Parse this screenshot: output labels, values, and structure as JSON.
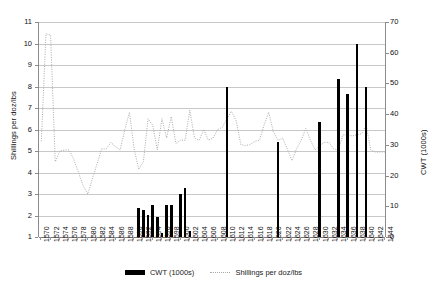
{
  "chart_data": {
    "type": "bar",
    "title": "",
    "subtitle": "",
    "xlabel": "",
    "ylabel": "Shillings per doz/lbs",
    "y2label": "CWT (1000s)",
    "ylim": [
      1,
      11
    ],
    "y2lim": [
      0,
      70
    ],
    "yticks": [
      1,
      2,
      3,
      4,
      5,
      6,
      7,
      8,
      9,
      10,
      11
    ],
    "y2ticks": [
      0,
      10,
      20,
      30,
      40,
      50,
      60,
      70
    ],
    "grid": true,
    "legend_position": "bottom",
    "x": [
      1570,
      1571,
      1572,
      1573,
      1574,
      1575,
      1576,
      1577,
      1578,
      1579,
      1580,
      1581,
      1582,
      1583,
      1584,
      1585,
      1586,
      1587,
      1588,
      1589,
      1590,
      1591,
      1592,
      1593,
      1594,
      1595,
      1596,
      1597,
      1598,
      1599,
      1600,
      1601,
      1602,
      1603,
      1604,
      1605,
      1606,
      1607,
      1608,
      1609,
      1610,
      1611,
      1612,
      1613,
      1614,
      1615,
      1616,
      1617,
      1618,
      1619,
      1620,
      1621,
      1622,
      1623,
      1624,
      1625,
      1626,
      1627,
      1628,
      1629,
      1630,
      1631,
      1632,
      1633,
      1634,
      1635,
      1636,
      1637,
      1638,
      1639,
      1640,
      1641,
      1642,
      1643,
      1644
    ],
    "xticks": [
      1570,
      1572,
      1574,
      1576,
      1578,
      1580,
      1582,
      1584,
      1586,
      1588,
      1590,
      1592,
      1594,
      1596,
      1598,
      1600,
      1602,
      1604,
      1606,
      1608,
      1610,
      1612,
      1614,
      1616,
      1618,
      1620,
      1622,
      1624,
      1626,
      1628,
      1630,
      1632,
      1634,
      1636,
      1638,
      1640,
      1642,
      1644
    ],
    "series": [
      {
        "name": "CWT (1000s)",
        "type": "bar",
        "axis": "right",
        "color": "#000000",
        "points": [
          {
            "x": 1591,
            "y": 9.6
          },
          {
            "x": 1592,
            "y": 8.9
          },
          {
            "x": 1593,
            "y": 7.2
          },
          {
            "x": 1594,
            "y": 10.3
          },
          {
            "x": 1595,
            "y": 6.4
          },
          {
            "x": 1596,
            "y": 1.2
          },
          {
            "x": 1597,
            "y": 10.4
          },
          {
            "x": 1598,
            "y": 10.4
          },
          {
            "x": 1600,
            "y": 14.1
          },
          {
            "x": 1601,
            "y": 16.0
          },
          {
            "x": 1602,
            "y": 2.0
          },
          {
            "x": 1610,
            "y": 49.0
          },
          {
            "x": 1621,
            "y": 31.0
          },
          {
            "x": 1630,
            "y": 37.3
          },
          {
            "x": 1634,
            "y": 51.3
          },
          {
            "x": 1636,
            "y": 46.5
          },
          {
            "x": 1638,
            "y": 62.8
          },
          {
            "x": 1640,
            "y": 49.0
          }
        ]
      },
      {
        "name": "Shillings per doz/lbs",
        "type": "line",
        "axis": "left",
        "color": "#aaaaaa",
        "style": "dotted",
        "points": [
          {
            "x": 1570,
            "y": 5.45
          },
          {
            "x": 1571,
            "y": 10.45
          },
          {
            "x": 1572,
            "y": 10.4
          },
          {
            "x": 1573,
            "y": 4.5
          },
          {
            "x": 1574,
            "y": 5.0
          },
          {
            "x": 1575,
            "y": 5.05
          },
          {
            "x": 1576,
            "y": 5.05
          },
          {
            "x": 1577,
            "y": 4.6
          },
          {
            "x": 1578,
            "y": 4.0
          },
          {
            "x": 1579,
            "y": 3.4
          },
          {
            "x": 1580,
            "y": 3.0
          },
          {
            "x": 1581,
            "y": 3.7
          },
          {
            "x": 1582,
            "y": 4.4
          },
          {
            "x": 1583,
            "y": 5.1
          },
          {
            "x": 1584,
            "y": 5.1
          },
          {
            "x": 1585,
            "y": 5.4
          },
          {
            "x": 1586,
            "y": 5.2
          },
          {
            "x": 1587,
            "y": 5.05
          },
          {
            "x": 1588,
            "y": 6.0
          },
          {
            "x": 1589,
            "y": 6.8
          },
          {
            "x": 1590,
            "y": 5.1
          },
          {
            "x": 1591,
            "y": 4.15
          },
          {
            "x": 1592,
            "y": 4.5
          },
          {
            "x": 1593,
            "y": 6.5
          },
          {
            "x": 1594,
            "y": 6.2
          },
          {
            "x": 1595,
            "y": 5.05
          },
          {
            "x": 1596,
            "y": 6.5
          },
          {
            "x": 1597,
            "y": 5.6
          },
          {
            "x": 1598,
            "y": 6.6
          },
          {
            "x": 1599,
            "y": 5.35
          },
          {
            "x": 1600,
            "y": 5.5
          },
          {
            "x": 1601,
            "y": 5.5
          },
          {
            "x": 1602,
            "y": 6.9
          },
          {
            "x": 1603,
            "y": 5.6
          },
          {
            "x": 1604,
            "y": 5.5
          },
          {
            "x": 1605,
            "y": 6.0
          },
          {
            "x": 1606,
            "y": 5.5
          },
          {
            "x": 1607,
            "y": 5.6
          },
          {
            "x": 1608,
            "y": 6.0
          },
          {
            "x": 1609,
            "y": 6.1
          },
          {
            "x": 1610,
            "y": 6.5
          },
          {
            "x": 1611,
            "y": 6.85
          },
          {
            "x": 1612,
            "y": 6.4
          },
          {
            "x": 1613,
            "y": 5.3
          },
          {
            "x": 1614,
            "y": 5.25
          },
          {
            "x": 1615,
            "y": 5.3
          },
          {
            "x": 1616,
            "y": 5.45
          },
          {
            "x": 1617,
            "y": 5.5
          },
          {
            "x": 1618,
            "y": 6.2
          },
          {
            "x": 1619,
            "y": 6.8
          },
          {
            "x": 1620,
            "y": 5.9
          },
          {
            "x": 1621,
            "y": 5.5
          },
          {
            "x": 1622,
            "y": 5.6
          },
          {
            "x": 1623,
            "y": 5.1
          },
          {
            "x": 1624,
            "y": 4.55
          },
          {
            "x": 1625,
            "y": 5.1
          },
          {
            "x": 1626,
            "y": 5.5
          },
          {
            "x": 1627,
            "y": 6.05
          },
          {
            "x": 1628,
            "y": 5.5
          },
          {
            "x": 1629,
            "y": 5.05
          },
          {
            "x": 1630,
            "y": 5.25
          },
          {
            "x": 1631,
            "y": 5.4
          },
          {
            "x": 1632,
            "y": 5.4
          },
          {
            "x": 1633,
            "y": 5.1
          },
          {
            "x": 1634,
            "y": 5.05
          },
          {
            "x": 1635,
            "y": 5.75
          },
          {
            "x": 1636,
            "y": 5.75
          },
          {
            "x": 1637,
            "y": 5.7
          },
          {
            "x": 1638,
            "y": 5.75
          },
          {
            "x": 1639,
            "y": 5.8
          },
          {
            "x": 1640,
            "y": 6.2
          },
          {
            "x": 1641,
            "y": 5.05
          },
          {
            "x": 1642,
            "y": 4.95
          },
          {
            "x": 1643,
            "y": 4.95
          },
          {
            "x": 1644,
            "y": 4.95
          }
        ]
      }
    ],
    "legend": [
      {
        "label": "CWT (1000s)",
        "marker": "bar",
        "color": "#000000"
      },
      {
        "label": "Shillings per doz/lbs",
        "marker": "dotted-line",
        "color": "#aaaaaa"
      }
    ]
  }
}
